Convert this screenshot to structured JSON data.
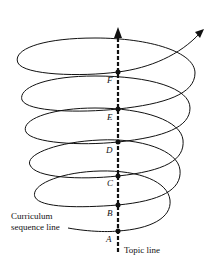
{
  "diagram": {
    "type": "spiral-curriculum",
    "points": [
      "F",
      "E",
      "D",
      "C",
      "B",
      "A"
    ],
    "labels": {
      "curriculum_line": [
        "Curriculum",
        "sequence line"
      ],
      "topic_line": "Topic line"
    },
    "colors": {
      "ink": "#111111",
      "background": "#ffffff"
    }
  }
}
